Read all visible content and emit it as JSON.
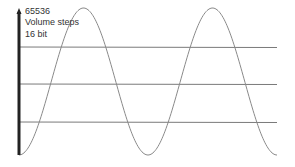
{
  "labels": {
    "max_value": "65536",
    "units": "Volume steps",
    "bit_depth": "16 bit"
  },
  "colors": {
    "axis": "#222222",
    "wave": "#8a8a8a",
    "gridline": "#7a7a7a",
    "text": "#333333"
  },
  "wave": {
    "type": "sine",
    "start_x": 19,
    "end_x": 277,
    "period_px": 129,
    "y_top": 8,
    "y_bottom": 155
  },
  "gridlines_y": [
    47,
    84,
    122
  ]
}
